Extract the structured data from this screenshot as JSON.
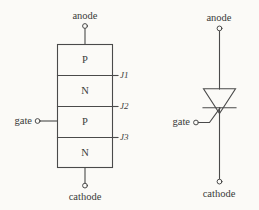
{
  "figure": {
    "background_color": "#fbfaf7",
    "line_color": "#4a4a4a",
    "text_color": "#3a3a3a"
  },
  "structure_diagram": {
    "name": "four-layer-pnpn-structure",
    "anode_label": "anode",
    "cathode_label": "cathode",
    "gate_label": "gate",
    "layers": [
      {
        "id": "layer-1",
        "material": "P"
      },
      {
        "id": "layer-2",
        "material": "N"
      },
      {
        "id": "layer-3",
        "material": "P"
      },
      {
        "id": "layer-4",
        "material": "N"
      }
    ],
    "junctions": [
      {
        "id": "junction-1",
        "label": "J1"
      },
      {
        "id": "junction-2",
        "label": "J2"
      },
      {
        "id": "junction-3",
        "label": "J3"
      }
    ]
  },
  "symbol_diagram": {
    "name": "thyristor-circuit-symbol",
    "anode_label": "anode",
    "cathode_label": "cathode",
    "gate_label": "gate"
  }
}
